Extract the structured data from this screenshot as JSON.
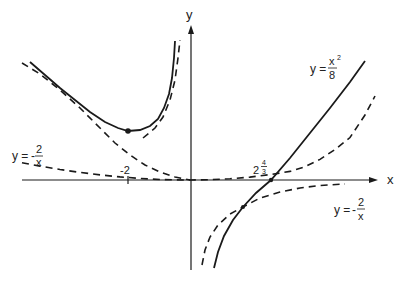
{
  "axes": {
    "x_label": "x",
    "y_label": "y",
    "origin_px": [
      191,
      180
    ],
    "x_unit_px": 31.5,
    "y_unit_px": 32.5
  },
  "ticks": {
    "neg_two": "-2",
    "root_whole": "2",
    "root_index_num": "4",
    "root_index_den": "3"
  },
  "labels": {
    "parabola": {
      "lhs": "y =",
      "num": "x",
      "exp": "2",
      "den": "8"
    },
    "hyperbola_left": {
      "lhs": "y =",
      "sign": "-",
      "num": "2",
      "den": "x"
    },
    "hyperbola_right": {
      "lhs": "y =",
      "sign": "-",
      "num": "2",
      "den": "x"
    }
  },
  "curves": [
    {
      "name": "y = x^2/8",
      "style": "dashed"
    },
    {
      "name": "y = -2/x",
      "style": "dashed"
    },
    {
      "name": "y = x^2/8 - 2/x",
      "style": "solid"
    }
  ],
  "points": [
    {
      "name": "local-minimum",
      "x": -2,
      "y": 1.5
    },
    {
      "name": "x-intercept",
      "x": 2.52,
      "y": 0
    },
    {
      "name": "intersection",
      "x": 1.65,
      "y": -0.85
    }
  ],
  "colors": {
    "ink": "#1a1a1a",
    "background": "#ffffff"
  }
}
